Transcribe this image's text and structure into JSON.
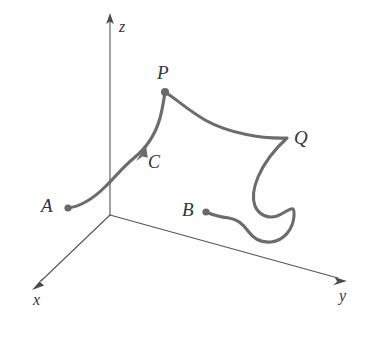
{
  "figure": {
    "kind": "3d-space-curve-diagram",
    "width": 374,
    "height": 345,
    "background_color": "#fefefe",
    "curve_color": "#6c6c70",
    "axis_color": "#55555a",
    "label_color": "#343438"
  },
  "axes": {
    "origin": {
      "x": 110,
      "y": 215
    },
    "items": [
      {
        "id": "z",
        "label": "z",
        "label_x": 119,
        "label_y": 19,
        "from": {
          "x": 110,
          "y": 215
        },
        "to": {
          "x": 110,
          "y": 16
        },
        "arrow": true
      },
      {
        "id": "x",
        "label": "x",
        "label_x": 33,
        "label_y": 292,
        "from": {
          "x": 110,
          "y": 215
        },
        "to": {
          "x": 36,
          "y": 284
        },
        "arrow": true
      },
      {
        "id": "y",
        "label": "y",
        "label_x": 339,
        "label_y": 288,
        "from": {
          "x": 110,
          "y": 215
        },
        "to": {
          "x": 345,
          "y": 280
        },
        "arrow": true
      }
    ]
  },
  "curve": {
    "name": "C",
    "label": "C",
    "label_x": 148,
    "label_y": 153,
    "direction_arrow": {
      "x": 143,
      "y": 152,
      "angle_deg": -57
    },
    "description": "Oriented space curve C running from point A, up past the z-axis to P, across to Q, then down through a loop and back to B."
  },
  "points": [
    {
      "id": "A",
      "label": "A",
      "dot_x": 68,
      "dot_y": 208,
      "label_x": 41,
      "label_y": 196,
      "role": "initial-point"
    },
    {
      "id": "P",
      "label": "P",
      "dot_x": 165,
      "dot_y": 92,
      "label_x": 157,
      "label_y": 63,
      "role": "interior-point"
    },
    {
      "id": "Q",
      "label": "Q",
      "dot_x": 287,
      "dot_y": 138,
      "label_x": 294,
      "label_y": 128,
      "role": "interior-point"
    },
    {
      "id": "B",
      "label": "B",
      "dot_x": 206,
      "dot_y": 212,
      "label_x": 182,
      "label_y": 200,
      "role": "terminal-point"
    }
  ]
}
